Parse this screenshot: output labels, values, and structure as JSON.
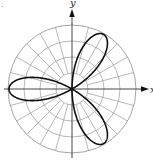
{
  "chart_data": {
    "type": "line",
    "subtype": "polar",
    "title": "",
    "equation_hint": "three-petal rose, r = -cos(3θ)",
    "xlabel": "x",
    "ylabel": "y",
    "grid": {
      "on": true,
      "rings": 4,
      "ring_values": [
        0.25,
        0.5,
        0.75,
        1.0
      ],
      "radial_spacing_deg": 15,
      "radial_lines_start_ring": 1
    },
    "petals": [
      {
        "angle_deg": 60,
        "length": 1.0
      },
      {
        "angle_deg": 180,
        "length": 1.0
      },
      {
        "angle_deg": 300,
        "length": 1.0
      }
    ],
    "rlim": [
      0,
      1
    ],
    "legend": null
  },
  "labels": {
    "x_axis": "x",
    "y_axis": "y",
    "corner_mark": "."
  },
  "colors": {
    "grid": "#9a9a9a",
    "axes": "#333333",
    "curve": "#111111"
  }
}
